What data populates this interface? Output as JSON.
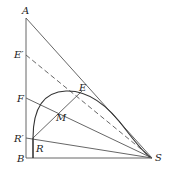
{
  "diagram": {
    "labels": {
      "A": "A",
      "E_prime": "E′",
      "F": "F",
      "R_prime": "R′",
      "B": "B",
      "R": "R",
      "M": "M",
      "E": "E",
      "S": "S"
    },
    "colors": {
      "line": "#555555",
      "curve": "#333333",
      "text": "#222222"
    }
  }
}
